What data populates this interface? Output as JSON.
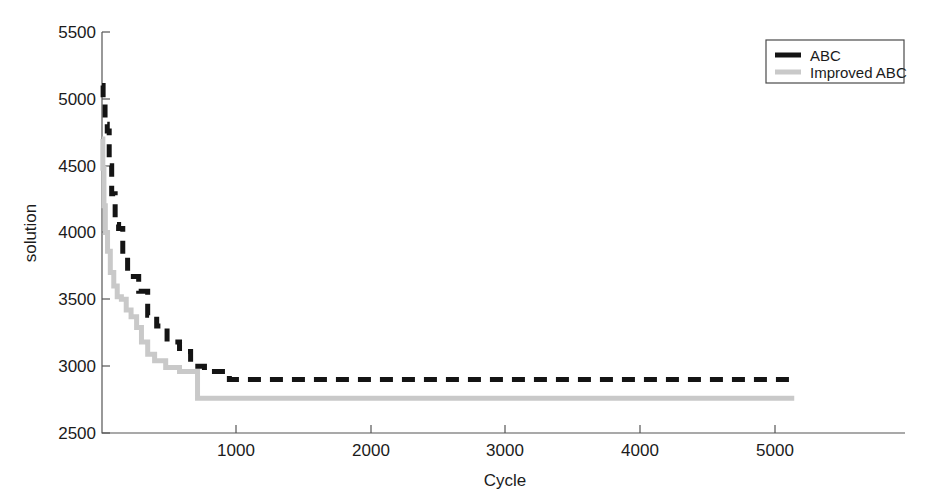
{
  "chart_data": {
    "type": "line",
    "title": "",
    "xlabel": "Cycle",
    "ylabel": "solution",
    "xlim": [
      0,
      5800
    ],
    "ylim": [
      2500,
      5500
    ],
    "xticks": [
      1000,
      2000,
      3000,
      4000,
      5000
    ],
    "yticks": [
      2500,
      3000,
      3500,
      4000,
      4500,
      5000,
      5500
    ],
    "grid": false,
    "legend_position": "top-right",
    "series": [
      {
        "name": "ABC",
        "color": "#141414",
        "style": "dashed",
        "points": [
          [
            0,
            5100
          ],
          [
            8,
            5100
          ],
          [
            8,
            5010
          ],
          [
            22,
            5010
          ],
          [
            22,
            4810
          ],
          [
            38,
            4810
          ],
          [
            38,
            4760
          ],
          [
            52,
            4760
          ],
          [
            52,
            4500
          ],
          [
            70,
            4500
          ],
          [
            70,
            4290
          ],
          [
            95,
            4290
          ],
          [
            95,
            4060
          ],
          [
            120,
            4060
          ],
          [
            120,
            4030
          ],
          [
            150,
            4030
          ],
          [
            150,
            3830
          ],
          [
            185,
            3830
          ],
          [
            185,
            3670
          ],
          [
            265,
            3670
          ],
          [
            265,
            3560
          ],
          [
            330,
            3560
          ],
          [
            330,
            3380
          ],
          [
            395,
            3380
          ],
          [
            395,
            3300
          ],
          [
            470,
            3300
          ],
          [
            470,
            3180
          ],
          [
            560,
            3180
          ],
          [
            560,
            3110
          ],
          [
            640,
            3110
          ],
          [
            640,
            3000
          ],
          [
            740,
            3000
          ],
          [
            740,
            2960
          ],
          [
            920,
            2960
          ],
          [
            920,
            2900
          ],
          [
            5000,
            2900
          ]
        ]
      },
      {
        "name": "Improved ABC",
        "color": "#c9c9c9",
        "style": "solid",
        "points": [
          [
            0,
            4700
          ],
          [
            6,
            4700
          ],
          [
            6,
            4480
          ],
          [
            14,
            4480
          ],
          [
            14,
            4200
          ],
          [
            24,
            4200
          ],
          [
            24,
            4000
          ],
          [
            40,
            4000
          ],
          [
            40,
            3860
          ],
          [
            60,
            3860
          ],
          [
            60,
            3700
          ],
          [
            85,
            3700
          ],
          [
            85,
            3600
          ],
          [
            110,
            3600
          ],
          [
            110,
            3520
          ],
          [
            140,
            3520
          ],
          [
            140,
            3500
          ],
          [
            175,
            3500
          ],
          [
            175,
            3420
          ],
          [
            210,
            3420
          ],
          [
            210,
            3370
          ],
          [
            250,
            3370
          ],
          [
            250,
            3290
          ],
          [
            285,
            3290
          ],
          [
            285,
            3180
          ],
          [
            330,
            3180
          ],
          [
            330,
            3090
          ],
          [
            380,
            3090
          ],
          [
            380,
            3040
          ],
          [
            460,
            3040
          ],
          [
            460,
            2990
          ],
          [
            560,
            2990
          ],
          [
            560,
            2960
          ],
          [
            690,
            2960
          ],
          [
            690,
            2760
          ],
          [
            5000,
            2760
          ]
        ]
      }
    ]
  },
  "axes": {
    "ylabel": "solution",
    "xlabel": "Cycle",
    "ytick_labels": [
      "2500",
      "3000",
      "3500",
      "4000",
      "4500",
      "5000",
      "5500"
    ],
    "xtick_labels": [
      "1000",
      "2000",
      "3000",
      "4000",
      "5000"
    ]
  },
  "legend": {
    "items": [
      {
        "label": "ABC",
        "color": "#141414"
      },
      {
        "label": "Improved ABC",
        "color": "#c9c9c9"
      }
    ]
  }
}
